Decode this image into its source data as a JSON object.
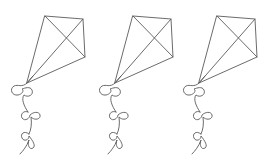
{
  "image": {
    "description": "Three identical line-art kites with bow-tied tails",
    "background": "#ffffff",
    "stroke_color": "#5a5a5a",
    "kite_count": 3
  },
  "kites": [
    {
      "label": "kite-1",
      "offset_x": 0
    },
    {
      "label": "kite-2",
      "offset_x": 88
    },
    {
      "label": "kite-3",
      "offset_x": 172
    }
  ]
}
